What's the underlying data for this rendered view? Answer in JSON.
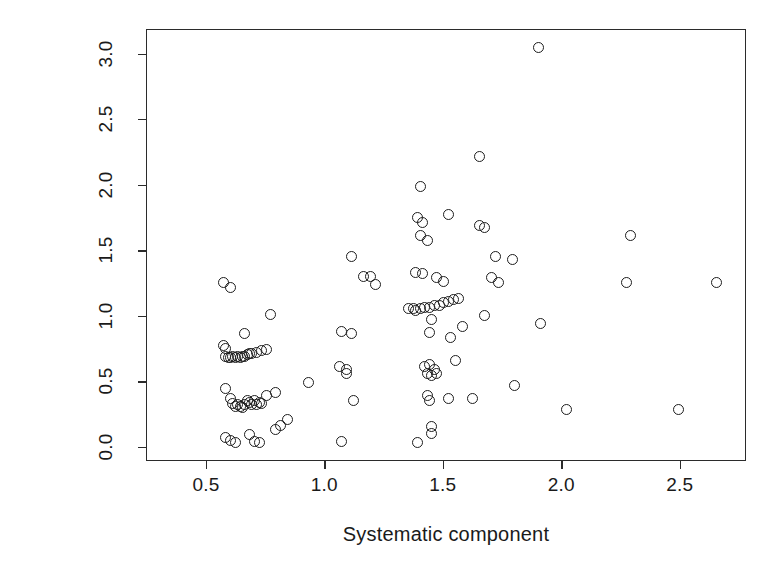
{
  "chart_data": {
    "type": "scatter",
    "title": "",
    "xlabel": "Systematic component",
    "ylabel": "Absolute scaled Pearson residuals",
    "xlim": [
      0.247,
      2.78
    ],
    "ylim": [
      -0.107,
      3.187
    ],
    "xticks": [
      0.5,
      1.0,
      1.5,
      2.0,
      2.5
    ],
    "xticklabels": [
      "0.5",
      "1.0",
      "1.5",
      "2.0",
      "2.5"
    ],
    "yticks": [
      0.0,
      0.5,
      1.0,
      1.5,
      2.0,
      2.5,
      3.0
    ],
    "yticklabels": [
      "0.0",
      "0.5",
      "1.0",
      "1.5",
      "2.0",
      "2.5",
      "3.0"
    ],
    "grid": false,
    "legend": false,
    "marker": "open-circle",
    "marker_color": "#1d1d1d",
    "points": [
      [
        0.57,
        1.26
      ],
      [
        0.6,
        1.22
      ],
      [
        0.57,
        0.78
      ],
      [
        0.58,
        0.76
      ],
      [
        0.58,
        0.7
      ],
      [
        0.59,
        0.69
      ],
      [
        0.6,
        0.69
      ],
      [
        0.61,
        0.7
      ],
      [
        0.62,
        0.69
      ],
      [
        0.63,
        0.7
      ],
      [
        0.64,
        0.69
      ],
      [
        0.65,
        0.7
      ],
      [
        0.66,
        0.7
      ],
      [
        0.67,
        0.71
      ],
      [
        0.68,
        0.72
      ],
      [
        0.69,
        0.72
      ],
      [
        0.71,
        0.73
      ],
      [
        0.73,
        0.74
      ],
      [
        0.75,
        0.75
      ],
      [
        0.66,
        0.87
      ],
      [
        0.77,
        1.02
      ],
      [
        0.58,
        0.45
      ],
      [
        0.6,
        0.38
      ],
      [
        0.61,
        0.34
      ],
      [
        0.62,
        0.32
      ],
      [
        0.63,
        0.33
      ],
      [
        0.64,
        0.32
      ],
      [
        0.65,
        0.31
      ],
      [
        0.66,
        0.33
      ],
      [
        0.67,
        0.36
      ],
      [
        0.68,
        0.35
      ],
      [
        0.69,
        0.33
      ],
      [
        0.7,
        0.36
      ],
      [
        0.71,
        0.33
      ],
      [
        0.72,
        0.35
      ],
      [
        0.73,
        0.34
      ],
      [
        0.75,
        0.4
      ],
      [
        0.79,
        0.42
      ],
      [
        0.58,
        0.08
      ],
      [
        0.6,
        0.06
      ],
      [
        0.62,
        0.04
      ],
      [
        0.68,
        0.1
      ],
      [
        0.7,
        0.05
      ],
      [
        0.72,
        0.04
      ],
      [
        0.79,
        0.14
      ],
      [
        0.81,
        0.17
      ],
      [
        0.84,
        0.22
      ],
      [
        0.93,
        0.5
      ],
      [
        1.06,
        0.62
      ],
      [
        1.09,
        0.6
      ],
      [
        1.07,
        0.89
      ],
      [
        1.11,
        0.87
      ],
      [
        1.11,
        1.46
      ],
      [
        1.07,
        0.05
      ],
      [
        1.09,
        0.57
      ],
      [
        1.12,
        0.36
      ],
      [
        1.16,
        1.31
      ],
      [
        1.19,
        1.31
      ],
      [
        1.21,
        1.25
      ],
      [
        1.4,
        1.99
      ],
      [
        1.39,
        1.76
      ],
      [
        1.41,
        1.72
      ],
      [
        1.52,
        1.78
      ],
      [
        1.4,
        1.62
      ],
      [
        1.43,
        1.58
      ],
      [
        1.65,
        2.22
      ],
      [
        1.65,
        1.7
      ],
      [
        1.67,
        1.68
      ],
      [
        1.72,
        1.46
      ],
      [
        1.79,
        1.44
      ],
      [
        1.38,
        1.34
      ],
      [
        1.41,
        1.33
      ],
      [
        1.47,
        1.3
      ],
      [
        1.5,
        1.27
      ],
      [
        1.7,
        1.3
      ],
      [
        1.73,
        1.26
      ],
      [
        1.35,
        1.06
      ],
      [
        1.37,
        1.06
      ],
      [
        1.38,
        1.05
      ],
      [
        1.4,
        1.06
      ],
      [
        1.42,
        1.07
      ],
      [
        1.44,
        1.07
      ],
      [
        1.46,
        1.09
      ],
      [
        1.48,
        1.09
      ],
      [
        1.5,
        1.11
      ],
      [
        1.52,
        1.12
      ],
      [
        1.54,
        1.13
      ],
      [
        1.56,
        1.14
      ],
      [
        1.67,
        1.01
      ],
      [
        1.58,
        0.93
      ],
      [
        1.9,
        3.05
      ],
      [
        1.91,
        0.95
      ],
      [
        1.62,
        0.38
      ],
      [
        1.8,
        0.48
      ],
      [
        1.45,
        0.98
      ],
      [
        1.44,
        0.88
      ],
      [
        1.53,
        0.84
      ],
      [
        1.42,
        0.62
      ],
      [
        1.44,
        0.64
      ],
      [
        1.46,
        0.6
      ],
      [
        1.43,
        0.57
      ],
      [
        1.45,
        0.55
      ],
      [
        1.47,
        0.57
      ],
      [
        1.55,
        0.67
      ],
      [
        1.43,
        0.4
      ],
      [
        1.44,
        0.36
      ],
      [
        1.52,
        0.38
      ],
      [
        1.45,
        0.16
      ],
      [
        1.45,
        0.11
      ],
      [
        1.39,
        0.04
      ],
      [
        2.02,
        0.29
      ],
      [
        2.29,
        1.62
      ],
      [
        2.27,
        1.26
      ],
      [
        2.49,
        0.29
      ],
      [
        2.65,
        1.26
      ]
    ]
  }
}
